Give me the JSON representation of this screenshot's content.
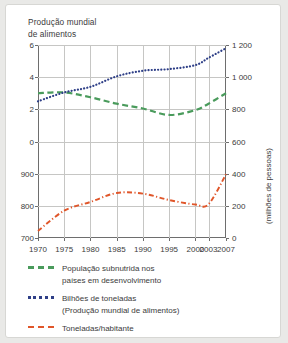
{
  "figure": {
    "title": "Produção mundial\nde alimentos",
    "background": "#ffffff",
    "panel_border": "#d7d7d4"
  },
  "chart_data": {
    "type": "line",
    "title": "Produção mundial de alimentos",
    "xlabel": "",
    "ylabel_left": "",
    "ylabel_right": "(milhões de pessoas)",
    "grid": true,
    "legend_position": "below",
    "x": [
      1970,
      1975,
      1980,
      1985,
      1990,
      1995,
      2000,
      2003,
      2007
    ],
    "xticklabels": [
      "1970",
      "1975",
      "1980",
      "1985",
      "1990",
      "1995",
      "2000",
      "2003",
      "2007"
    ],
    "left_axis": {
      "upper_ticks": [
        0,
        2,
        4,
        6
      ],
      "upper_ticklabels": [
        "0",
        "2",
        "4",
        "6"
      ],
      "lower_ticks": [
        700,
        800,
        900
      ],
      "lower_ticklabels": [
        "700",
        "800",
        "900"
      ],
      "note": "eixo esquerdo duplo: bilhoes de toneladas em cima, toneladas/habitante embaixo"
    },
    "right_axis": {
      "ticks": [
        0,
        200,
        400,
        600,
        800,
        1000,
        1200
      ],
      "ticklabels": [
        "0",
        "200",
        "400",
        "600",
        "800",
        "1 000",
        "1 200"
      ],
      "label": "(milhões de pessoas)"
    },
    "series": [
      {
        "name": "População subnutrida nos países em desenvolvimento",
        "style": "dashed",
        "color": "#4a9b5c",
        "axis": "left-upper",
        "unit": "equivalente em milhões de pessoas (eixo direito)",
        "values": [
          3.0,
          3.05,
          2.75,
          2.35,
          2.05,
          1.65,
          1.95,
          2.35,
          3.0
        ],
        "values_right_axis_millions": [
          900,
          910,
          860,
          815,
          780,
          740,
          770,
          815,
          900
        ]
      },
      {
        "name": "Bilhões de toneladas (Produção mundial de alimentos)",
        "style": "dotted",
        "color": "#2e3f87",
        "axis": "left-upper",
        "unit": "bilhões de toneladas",
        "values": [
          2.5,
          3.05,
          3.4,
          4.05,
          4.4,
          4.5,
          4.75,
          5.2,
          5.8
        ]
      },
      {
        "name": "Toneladas/habitante",
        "style": "dash-dot",
        "color": "#e0562a",
        "axis": "left-lower",
        "unit": "toneladas/habitante",
        "values": [
          722,
          785,
          812,
          840,
          838,
          818,
          804,
          805,
          898
        ],
        "values_right_axis_millions": [
          45,
          170,
          225,
          280,
          276,
          236,
          208,
          210,
          395
        ]
      }
    ]
  },
  "legend": [
    {
      "marker": "dashed-green",
      "color": "#4a9b5c",
      "label": "População subnutrida nos\npaíses em desenvolvimento"
    },
    {
      "marker": "dotted-blue",
      "color": "#2e3f87",
      "label": "Bilhões de toneladas\n(Produção mundial de alimentos)"
    },
    {
      "marker": "dash-dot-orange",
      "color": "#e0562a",
      "label": "Toneladas/habitante"
    }
  ]
}
